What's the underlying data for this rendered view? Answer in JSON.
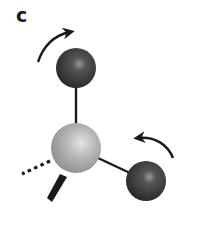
{
  "figure": {
    "panel_label": "c",
    "colors": {
      "background": "#ffffff",
      "central_atom": "#a8a8a8",
      "peripheral_atom": "#3a3a3a",
      "bond": "#1a1a1a",
      "arrow": "#1a1a1a"
    },
    "atoms": [
      {
        "id": "top",
        "cx": 76,
        "cy": 68,
        "r": 20,
        "shade": "dark"
      },
      {
        "id": "center",
        "cx": 76,
        "cy": 148,
        "r": 25,
        "shade": "light"
      },
      {
        "id": "right",
        "cx": 146,
        "cy": 181,
        "r": 20,
        "shade": "dark"
      }
    ],
    "bonds": [
      {
        "from": "center",
        "to": "top",
        "style": "solid"
      },
      {
        "from": "center",
        "to": "right",
        "style": "solid"
      },
      {
        "from": "center",
        "to": "back-left",
        "style": "dashed"
      },
      {
        "from": "center",
        "to": "front-down",
        "style": "wedge"
      }
    ],
    "arrows": [
      {
        "id": "top-arrow",
        "direction": "clockwise"
      },
      {
        "id": "right-arrow",
        "direction": "counterclockwise"
      }
    ]
  }
}
